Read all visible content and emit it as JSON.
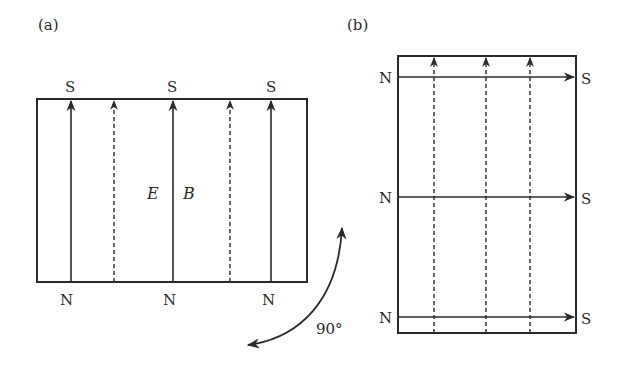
{
  "panel_a": {
    "label": "(a)",
    "top_labels": [
      "S",
      "S",
      "S"
    ],
    "bottom_labels": [
      "N",
      "N",
      "N"
    ],
    "field_labels": {
      "E": "E",
      "B": "B"
    }
  },
  "panel_b": {
    "label": "(b)",
    "left_labels": [
      "N",
      "N",
      "N"
    ],
    "right_labels": [
      "S",
      "S",
      "S"
    ]
  },
  "rotation": {
    "label": "90°"
  },
  "colors": {
    "stroke": "#2a2a2a",
    "background": "#ffffff"
  }
}
